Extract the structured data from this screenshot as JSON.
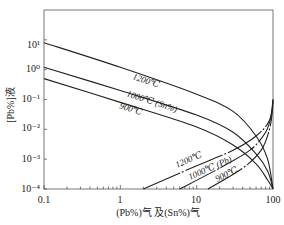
{
  "chart_data": {
    "type": "line",
    "title": "",
    "xlabel": "(Pb%)气 及(Sn%)气",
    "ylabel": "[Pb%]液",
    "xscale": "log",
    "yscale": "log",
    "xlim": [
      0.1,
      100
    ],
    "ylim": [
      0.0001,
      100
    ],
    "x_ticks": [
      "0.1",
      "1",
      "10",
      "100"
    ],
    "y_ticks": [
      "10⁻⁴",
      "10⁻³",
      "10⁻²",
      "10⁻¹",
      "10⁰",
      "10¹"
    ],
    "grid": false,
    "series": [
      {
        "name": "1200℃ (Sn%)",
        "group": "Sn",
        "label": "1200℃",
        "points": [
          [
            0.1,
            8
          ],
          [
            1,
            1.2
          ],
          [
            10,
            0.15
          ],
          [
            30,
            0.04
          ],
          [
            60,
            0.006
          ],
          [
            85,
            0.001
          ],
          [
            100,
            0.0001
          ]
        ]
      },
      {
        "name": "1000℃ (Sn%)",
        "group": "Sn",
        "label": "1000℃ (Sn%)",
        "points": [
          [
            0.1,
            1.2
          ],
          [
            1,
            0.2
          ],
          [
            10,
            0.03
          ],
          [
            30,
            0.008
          ],
          [
            60,
            0.0015
          ],
          [
            85,
            0.0004
          ],
          [
            100,
            0.0001
          ]
        ]
      },
      {
        "name": "900℃ (Sn%)",
        "group": "Sn",
        "label": "900℃",
        "points": [
          [
            0.1,
            0.5
          ],
          [
            1,
            0.08
          ],
          [
            10,
            0.012
          ],
          [
            30,
            0.003
          ],
          [
            60,
            0.0007
          ],
          [
            85,
            0.0002
          ],
          [
            100,
            0.0001
          ]
        ]
      },
      {
        "name": "1200℃ (Pb)",
        "group": "Pb",
        "label": "1200℃",
        "points": [
          [
            2,
            0.0001
          ],
          [
            10,
            0.0006
          ],
          [
            30,
            0.002
          ],
          [
            60,
            0.006
          ],
          [
            90,
            0.02
          ],
          [
            100,
            0.1
          ]
        ]
      },
      {
        "name": "1000℃ (Pb)",
        "group": "Pb",
        "label": "1000℃ (Pb)",
        "points": [
          [
            6,
            0.0001
          ],
          [
            20,
            0.0005
          ],
          [
            50,
            0.002
          ],
          [
            80,
            0.008
          ],
          [
            95,
            0.03
          ],
          [
            100,
            0.1
          ]
        ]
      },
      {
        "name": "900℃ (Pb)",
        "group": "Pb",
        "label": "900℃",
        "points": [
          [
            14,
            0.0001
          ],
          [
            40,
            0.0005
          ],
          [
            70,
            0.002
          ],
          [
            90,
            0.01
          ],
          [
            98,
            0.04
          ],
          [
            100,
            0.1
          ]
        ]
      }
    ],
    "labels": {
      "sn_1200": "1200℃",
      "sn_1000": "1000℃ (Sn%)",
      "sn_900": "900℃",
      "pb_1200": "1200℃",
      "pb_1000": "1000℃ (Pb)",
      "pb_900": "900℃"
    }
  }
}
